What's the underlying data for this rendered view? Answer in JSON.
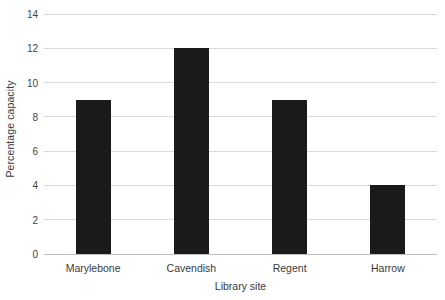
{
  "chart_data": {
    "type": "bar",
    "title": "",
    "xlabel": "Library site",
    "ylabel": "Percentage capacity",
    "categories": [
      "Marylebone",
      "Cavendish",
      "Regent",
      "Harrow"
    ],
    "values": [
      9,
      12,
      9,
      4
    ],
    "ylim": [
      0,
      14
    ],
    "ytick_labels": [
      "0",
      "2",
      "4",
      "6",
      "8",
      "10",
      "12",
      "14"
    ],
    "ytick_values": [
      0,
      2,
      4,
      6,
      8,
      10,
      12,
      14
    ],
    "grid": true,
    "legend": "none",
    "bar_color": "#1a1a1a",
    "gridline_color": "#d9d9d9",
    "background_color": "#ffffff",
    "text_color": "#3a3a3a"
  }
}
